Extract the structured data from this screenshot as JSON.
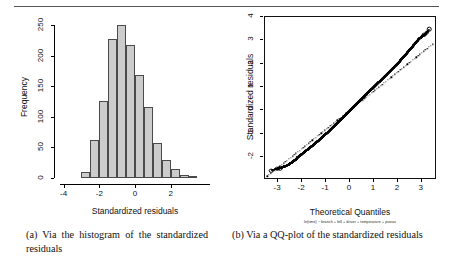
{
  "figure": {
    "panels": [
      {
        "tag": "a",
        "caption": "(a) Via the histogram of the standardized residuals"
      },
      {
        "tag": "b",
        "caption": "(b) Via a QQ-plot of the standardized residuals"
      }
    ]
  },
  "chart_data": [
    {
      "type": "bar",
      "title": "",
      "xlabel": "Standardized residuals",
      "ylabel": "Frequency",
      "xlim": [
        -4.2,
        4.2
      ],
      "ylim": [
        0,
        262
      ],
      "xticks": [
        -4,
        -2,
        0,
        2
      ],
      "yticks": [
        0,
        50,
        100,
        150,
        200,
        250
      ],
      "grid": false,
      "legend": null,
      "bin_edges": [
        -3.0,
        -2.5,
        -2.0,
        -1.5,
        -1.0,
        -0.5,
        0.0,
        0.5,
        1.0,
        1.5,
        2.0,
        2.5,
        3.0,
        3.5
      ],
      "categories": [
        "-3.0",
        "-2.5",
        "-2.0",
        "-1.5",
        "-1.0",
        "-0.5",
        "0.0",
        "0.5",
        "1.0",
        "1.5",
        "2.0",
        "2.5",
        "3.0"
      ],
      "values": [
        10,
        62,
        126,
        228,
        251,
        217,
        169,
        116,
        57,
        29,
        14,
        5,
        3
      ],
      "bar_fill": "#cccccc",
      "bar_edge": "#4a4a4a"
    },
    {
      "type": "scatter",
      "title": "",
      "xlabel": "Theoretical Quantiles",
      "ylabel": "Standardized residuals",
      "subtitle": "ln(time) ~ branch + bill + driver + temperature + pizzas",
      "xlim": [
        -3.55,
        3.55
      ],
      "ylim": [
        -2.9,
        4.0
      ],
      "xticks": [
        -3,
        -2,
        -1,
        0,
        1,
        2,
        3
      ],
      "yticks": [
        -2,
        -1,
        0,
        1,
        2,
        3,
        4
      ],
      "grid": false,
      "legend": null,
      "point_color": "#000000",
      "reference_line": {
        "slope": 0.82,
        "intercept": 0.0,
        "style": "dotted"
      },
      "x": [
        -3.3,
        -3.05,
        -2.92,
        -2.83,
        -2.76,
        -2.7,
        -2.64,
        -2.59,
        -2.54,
        -2.5,
        -2.46,
        -2.42,
        -2.38,
        -2.34,
        -2.3,
        -2.26,
        -2.22,
        -2.18,
        -2.14,
        -2.1,
        -2.05,
        -2.0,
        -1.95,
        -1.9,
        -1.85,
        -1.8,
        -1.75,
        -1.7,
        -1.65,
        -1.6,
        -1.55,
        -1.5,
        -1.45,
        -1.4,
        -1.35,
        -1.3,
        -1.25,
        -1.2,
        -1.15,
        -1.1,
        -1.05,
        -1.0,
        -0.95,
        -0.9,
        -0.85,
        -0.8,
        -0.75,
        -0.7,
        -0.65,
        -0.6,
        -0.55,
        -0.5,
        -0.45,
        -0.4,
        -0.35,
        -0.3,
        -0.25,
        -0.2,
        -0.15,
        -0.1,
        -0.05,
        0.0,
        0.05,
        0.1,
        0.15,
        0.2,
        0.25,
        0.3,
        0.35,
        0.4,
        0.45,
        0.5,
        0.55,
        0.6,
        0.65,
        0.7,
        0.75,
        0.8,
        0.85,
        0.9,
        0.95,
        1.0,
        1.05,
        1.1,
        1.15,
        1.2,
        1.25,
        1.3,
        1.35,
        1.4,
        1.45,
        1.5,
        1.55,
        1.6,
        1.65,
        1.7,
        1.75,
        1.8,
        1.85,
        1.9,
        1.95,
        2.0,
        2.05,
        2.1,
        2.15,
        2.2,
        2.25,
        2.3,
        2.35,
        2.4,
        2.45,
        2.5,
        2.55,
        2.6,
        2.65,
        2.7,
        2.75,
        2.8,
        2.85,
        2.9,
        2.95,
        3.0,
        3.05,
        3.1,
        3.2,
        3.3
      ],
      "y": [
        -2.58,
        -2.5,
        -2.47,
        -2.44,
        -2.41,
        -2.39,
        -2.36,
        -2.33,
        -2.31,
        -2.28,
        -2.25,
        -2.22,
        -2.19,
        -2.16,
        -2.13,
        -2.1,
        -2.05,
        -2.0,
        -1.97,
        -1.94,
        -1.9,
        -1.86,
        -1.82,
        -1.78,
        -1.74,
        -1.7,
        -1.66,
        -1.62,
        -1.58,
        -1.54,
        -1.5,
        -1.45,
        -1.41,
        -1.37,
        -1.32,
        -1.28,
        -1.23,
        -1.19,
        -1.14,
        -1.1,
        -1.05,
        -1.0,
        -0.96,
        -0.91,
        -0.86,
        -0.81,
        -0.76,
        -0.71,
        -0.66,
        -0.61,
        -0.56,
        -0.51,
        -0.46,
        -0.41,
        -0.36,
        -0.31,
        -0.26,
        -0.2,
        -0.15,
        -0.1,
        -0.05,
        0.0,
        0.05,
        0.1,
        0.15,
        0.2,
        0.25,
        0.3,
        0.35,
        0.4,
        0.45,
        0.5,
        0.56,
        0.61,
        0.66,
        0.71,
        0.76,
        0.81,
        0.86,
        0.91,
        0.96,
        1.01,
        1.06,
        1.11,
        1.16,
        1.21,
        1.26,
        1.31,
        1.36,
        1.41,
        1.46,
        1.51,
        1.56,
        1.61,
        1.66,
        1.71,
        1.76,
        1.81,
        1.86,
        1.92,
        1.97,
        2.02,
        2.07,
        2.13,
        2.19,
        2.25,
        2.3,
        2.36,
        2.42,
        2.48,
        2.54,
        2.6,
        2.66,
        2.72,
        2.78,
        2.84,
        2.9,
        2.97,
        3.03,
        3.08,
        3.12,
        3.16,
        3.2,
        3.24,
        3.32,
        3.47
      ],
      "outlier_open_points": [
        {
          "x": -3.3,
          "y": -2.58
        },
        {
          "x": -3.05,
          "y": -2.5
        },
        {
          "x": -2.92,
          "y": -2.47
        },
        {
          "x": 3.1,
          "y": 3.24
        },
        {
          "x": 3.2,
          "y": 3.32
        },
        {
          "x": 3.3,
          "y": 3.47
        }
      ]
    }
  ]
}
